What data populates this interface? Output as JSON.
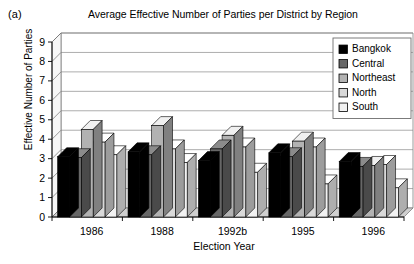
{
  "panel_label": "(a)",
  "axis": {
    "y_title": "Effective Number of Parties",
    "x_title": "Election Year"
  },
  "legend": {
    "position": "top-right",
    "items": [
      {
        "label": "Bangkok",
        "color": "#000000"
      },
      {
        "label": "Central",
        "color": "#676767"
      },
      {
        "label": "Northeast",
        "color": "#b2b2b2"
      },
      {
        "label": "North",
        "color": "#d9d9d9"
      },
      {
        "label": "South",
        "color": "#f2f2f2"
      }
    ]
  },
  "chart_data": {
    "type": "bar",
    "title": "Average Effective Number of Parties per District by Region",
    "xlabel": "Election Year",
    "ylabel": "Effective Number of Parties",
    "ylim": [
      0,
      9
    ],
    "yticks": [
      0,
      1,
      2,
      3,
      4,
      5,
      6,
      7,
      8,
      9
    ],
    "grid": true,
    "categories": [
      "1986",
      "1988",
      "1992b",
      "1995",
      "1996"
    ],
    "series": [
      {
        "name": "Bangkok",
        "color": "#000000",
        "values": [
          3.1,
          3.35,
          2.9,
          3.3,
          2.85
        ]
      },
      {
        "name": "Central",
        "color": "#676767",
        "values": [
          3.05,
          3.2,
          3.5,
          3.1,
          2.6
        ]
      },
      {
        "name": "Northeast",
        "color": "#b2b2b2",
        "values": [
          4.5,
          4.7,
          4.2,
          3.9,
          2.65
        ]
      },
      {
        "name": "North",
        "color": "#d9d9d9",
        "values": [
          3.85,
          3.5,
          3.6,
          3.6,
          2.7
        ]
      },
      {
        "name": "South",
        "color": "#f2f2f2",
        "values": [
          3.2,
          2.8,
          2.3,
          1.7,
          1.5
        ]
      }
    ]
  }
}
